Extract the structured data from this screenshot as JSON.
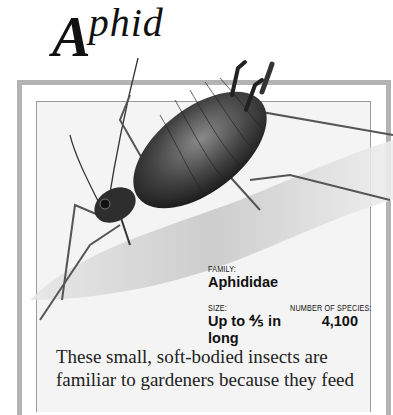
{
  "title": {
    "initial": "A",
    "rest": "phid"
  },
  "facts": {
    "family": {
      "label": "FAMILY:",
      "value": "Aphididae"
    },
    "size": {
      "label": "SIZE:",
      "value_line1": "Up to ⅘ in",
      "value_line2": "long"
    },
    "species": {
      "label": "NUMBER OF SPECIES:",
      "value": "4,100"
    }
  },
  "body": {
    "text": "These small, soft-bodied insects are familiar to gardeners because they feed"
  },
  "illustration": {
    "subject": "aphid-illustration",
    "frame_color": "#b3b3b3",
    "panel_color": "#f4f4f4"
  }
}
